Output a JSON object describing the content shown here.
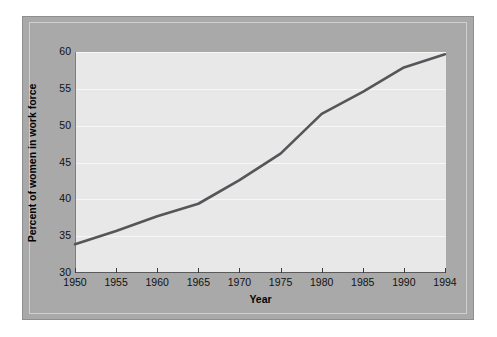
{
  "figure": {
    "background_color": "#ffffff",
    "panel_color": "#a9a9a9",
    "plot_background_color": "#e8e8e8",
    "line_color": "#55565a",
    "gridline_color": "#f7f7f7"
  },
  "chart_data": {
    "type": "line",
    "title": "",
    "xlabel": "Year",
    "ylabel": "Percent of women in work force",
    "xlim": [
      1950,
      1994
    ],
    "ylim": [
      30,
      60
    ],
    "grid": true,
    "legend": "none",
    "x_tick_labels": [
      "1950",
      "1955",
      "1960",
      "1965",
      "1970",
      "1975",
      "1980",
      "1985",
      "1990",
      "1994"
    ],
    "y_tick_labels": [
      "30",
      "35",
      "40",
      "45",
      "50",
      "55",
      "60"
    ],
    "x": [
      1950,
      1955,
      1960,
      1965,
      1970,
      1975,
      1980,
      1985,
      1990,
      1994
    ],
    "values": [
      33.9,
      35.7,
      37.7,
      39.4,
      42.6,
      46.2,
      51.6,
      54.6,
      57.9,
      59.7
    ],
    "series": [
      {
        "name": "Percent of women in work force",
        "values": [
          33.9,
          35.7,
          37.7,
          39.4,
          42.6,
          46.2,
          51.6,
          54.6,
          57.9,
          59.7
        ]
      }
    ]
  }
}
